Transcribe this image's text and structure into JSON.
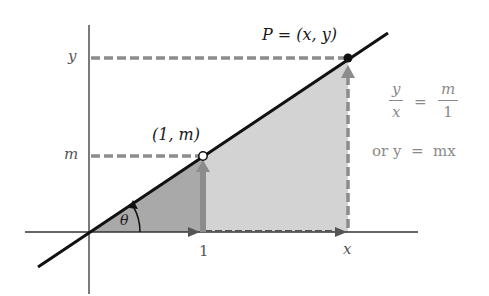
{
  "diagram": {
    "labels": {
      "point_p": "P = (x, y)",
      "point_one_m": "(1, m)",
      "axis_y_tick": "y",
      "axis_m_tick": "m",
      "axis_one_tick": "1",
      "axis_x_tick": "x",
      "angle": "θ"
    },
    "equation": {
      "frac_left_num": "y",
      "frac_left_den": "x",
      "equals": "=",
      "frac_right_num": "m",
      "frac_right_den": "1",
      "line2": "or y  =  mx"
    },
    "colors": {
      "line": "#111111",
      "axes": "#333333",
      "dashed": "#8c8c8c",
      "small_triangle": "#a8a8a8",
      "large_triangle": "#d2d2d2",
      "text_gray": "#8a8a8a"
    }
  }
}
